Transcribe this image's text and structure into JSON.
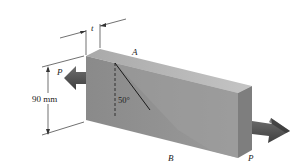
{
  "diagram": {
    "type": "engineering-mechanics-figure",
    "labels": {
      "point_a": "A",
      "point_b": "B",
      "load_left": "P",
      "load_right": "P",
      "thickness": "t",
      "height": "90 mm",
      "angle": "50°"
    },
    "colors": {
      "front_face": "#8f8f8f",
      "front_face_shadow": "#7a7a7a",
      "top_face": "#b9b9b9",
      "end_face": "#9c9c9c",
      "arrow": "#5e5e5e",
      "arrow_shadow": "#3d3d3d",
      "dim_line": "#333333"
    }
  }
}
